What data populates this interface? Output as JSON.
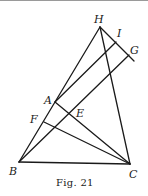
{
  "figure": {
    "caption": "Fig. 21",
    "points": {
      "H": {
        "label": "H",
        "x": 100,
        "y": 27
      },
      "I": {
        "label": "I",
        "x": 116,
        "y": 42
      },
      "G": {
        "label": "G",
        "x": 129,
        "y": 55
      },
      "A": {
        "label": "A",
        "x": 55,
        "y": 102
      },
      "E": {
        "label": "E",
        "x": 69,
        "y": 114
      },
      "F": {
        "label": "F",
        "x": 44,
        "y": 122
      },
      "B": {
        "label": "B",
        "x": 19,
        "y": 162
      },
      "C": {
        "label": "C",
        "x": 130,
        "y": 164
      }
    },
    "segments": [
      [
        "H",
        "B"
      ],
      [
        "H",
        "C"
      ],
      [
        "B",
        "C"
      ],
      [
        "H",
        "G"
      ],
      [
        "A",
        "I"
      ],
      [
        "A",
        "C"
      ],
      [
        "B",
        "G"
      ],
      [
        "F",
        "C"
      ]
    ]
  }
}
